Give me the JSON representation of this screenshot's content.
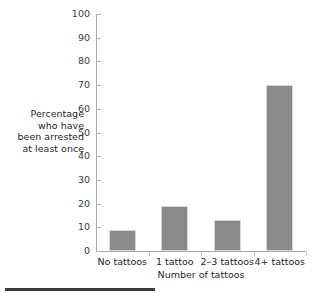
{
  "chart_data": {
    "type": "bar",
    "title": "",
    "subtitle": "",
    "categories": [
      "No tattoos",
      "1 tattoo",
      "2–3 tattoos",
      "4+ tattoos"
    ],
    "values": [
      9,
      19,
      13,
      70
    ],
    "xlabel": "Number of tattoos",
    "ylabel": "Percentage who have been arrested at least once",
    "ylabel_lines": [
      "Percentage",
      "who have",
      "been arrested",
      "at least once"
    ],
    "ylim": [
      0,
      100
    ],
    "ytick_step": 10,
    "yticks": [
      0,
      10,
      20,
      30,
      40,
      50,
      60,
      70,
      80,
      90,
      100
    ],
    "ytick_labels": [
      "0",
      "10",
      "20",
      "30",
      "40",
      "50",
      "60",
      "70",
      "80",
      "90",
      "100"
    ],
    "grid": false,
    "legend": false,
    "legend_position": "none",
    "series": [
      {
        "name": "Percentage who have been arrested at least once",
        "values": [
          9,
          19,
          13,
          70
        ]
      }
    ],
    "colors": {
      "bar_fill": "#8a8a8a",
      "bar_edge": "#d8d8d8",
      "axis_line": "#a9a9a9",
      "tick_mark": "#b5b5b5",
      "text": "#231f20",
      "bottom_rule": "#3b3b3b",
      "background": "#ffffff"
    }
  }
}
